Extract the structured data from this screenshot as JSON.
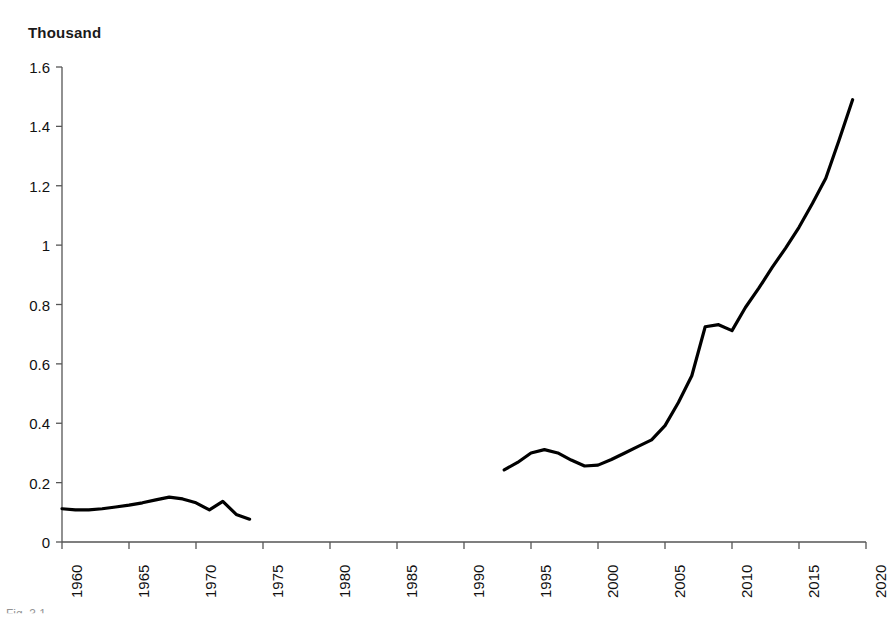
{
  "chart_data": {
    "type": "line",
    "title": "",
    "unit_label": "Thousand",
    "xlabel": "",
    "ylabel": "Thousand",
    "xlim": [
      1960,
      2020
    ],
    "ylim": [
      0,
      1.6
    ],
    "grid": false,
    "legend": null,
    "line_color": "#000000",
    "x_tick_labels": [
      "1960",
      "1965",
      "1970",
      "1975",
      "1980",
      "1985",
      "1990",
      "1995",
      "2000",
      "2005",
      "2010",
      "2015",
      "2020"
    ],
    "x_ticks": [
      1960,
      1965,
      1970,
      1975,
      1980,
      1985,
      1990,
      1995,
      2000,
      2005,
      2010,
      2015,
      2020
    ],
    "y_tick_labels": [
      "0",
      "0.2",
      "0.4",
      "0.6",
      "0.8",
      "1",
      "1.2",
      "1.4",
      "1.6"
    ],
    "y_ticks": [
      0,
      0.2,
      0.4,
      0.6,
      0.8,
      1,
      1.2,
      1.4,
      1.6
    ],
    "note": "Two disjoint segments; data missing 1975-1992",
    "series": [
      {
        "name": "segment-1",
        "x": [
          1960,
          1961,
          1962,
          1963,
          1964,
          1965,
          1966,
          1967,
          1968,
          1969,
          1970,
          1971,
          1972,
          1973,
          1974
        ],
        "values": [
          0.112,
          0.108,
          0.108,
          0.112,
          0.118,
          0.124,
          0.132,
          0.142,
          0.151,
          0.145,
          0.132,
          0.108,
          0.137,
          0.093,
          0.077
        ]
      },
      {
        "name": "segment-2",
        "x": [
          1993,
          1994,
          1995,
          1996,
          1997,
          1998,
          1999,
          2000,
          2001,
          2002,
          2003,
          2004,
          2005,
          2006,
          2007,
          2008,
          2009,
          2010,
          2011,
          2012,
          2013,
          2014,
          2015,
          2016,
          2017,
          2018,
          2019
        ],
        "values": [
          0.243,
          0.268,
          0.3,
          0.311,
          0.3,
          0.276,
          0.256,
          0.259,
          0.278,
          0.3,
          0.322,
          0.344,
          0.392,
          0.47,
          0.56,
          0.725,
          0.732,
          0.712,
          0.79,
          0.855,
          0.925,
          0.99,
          1.06,
          1.14,
          1.225,
          1.355,
          1.49
        ]
      }
    ]
  },
  "caption": {
    "text": "Fig. 3.1"
  }
}
